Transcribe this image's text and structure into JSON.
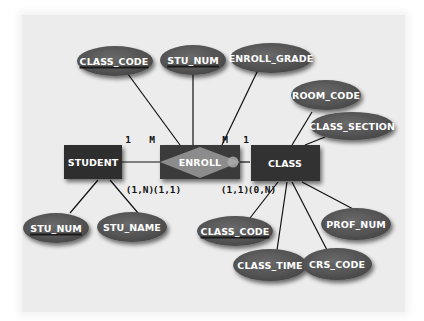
{
  "diagram": {
    "type": "entity-relationship",
    "colors": {
      "background": "#ececec",
      "entity_fill": "#333333",
      "relationship_fill": "#8a8a8a",
      "attribute_fill": "#555555",
      "line": "#111111",
      "label_text": "#ffffff"
    },
    "entities": [
      {
        "id": "student",
        "label": "STUDENT"
      },
      {
        "id": "class",
        "label": "CLASS"
      }
    ],
    "relationships": [
      {
        "id": "enroll",
        "label": "ENROLL",
        "weak_entity_box": true
      }
    ],
    "attributes": {
      "enroll_class_code": {
        "label": "CLASS_CODE",
        "key": true,
        "owner": "enroll"
      },
      "enroll_stu_num": {
        "label": "STU_NUM",
        "key": true,
        "owner": "enroll"
      },
      "enroll_grade": {
        "label": "ENROLL_GRADE",
        "key": false,
        "owner": "enroll"
      },
      "room_code": {
        "label": "ROOM_CODE",
        "key": false,
        "owner": "class"
      },
      "class_section": {
        "label": "CLASS_SECTION",
        "key": false,
        "owner": "class"
      },
      "stu_num": {
        "label": "STU_NUM",
        "key": true,
        "owner": "student"
      },
      "stu_name": {
        "label": "STU_NAME",
        "key": false,
        "owner": "student"
      },
      "class_code": {
        "label": "CLASS_CODE",
        "key": true,
        "owner": "class"
      },
      "class_time": {
        "label": "CLASS_TIME",
        "key": false,
        "owner": "class"
      },
      "crs_code": {
        "label": "CRS_CODE",
        "key": false,
        "owner": "class"
      },
      "prof_num": {
        "label": "PROF_NUM",
        "key": false,
        "owner": "class"
      }
    },
    "cardinality": {
      "student_side_conn": "1",
      "enroll_left_conn": "M",
      "enroll_right_conn": "M",
      "class_side_conn": "1",
      "student_card": "(1,N)",
      "enroll_left_card": "(1,1)",
      "enroll_right_card": "(1,1)",
      "class_card": "(0,N)"
    }
  }
}
